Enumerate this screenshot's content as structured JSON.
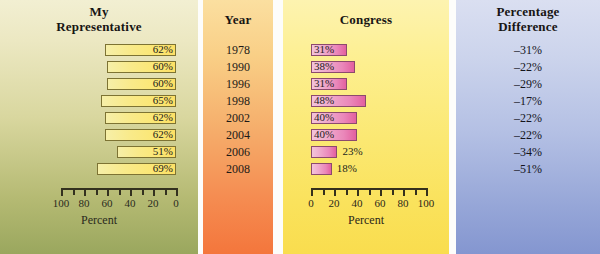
{
  "chart_data": {
    "type": "bar",
    "title": "",
    "categories": [
      "1978",
      "1990",
      "1996",
      "1998",
      "2002",
      "2004",
      "2006",
      "2008"
    ],
    "series": [
      {
        "name": "My Representative",
        "values": [
          62,
          60,
          60,
          65,
          62,
          62,
          51,
          69
        ],
        "unit": "%",
        "direction": "right-to-left",
        "xlim": [
          100,
          0
        ]
      },
      {
        "name": "Congress",
        "values": [
          31,
          38,
          31,
          48,
          40,
          40,
          23,
          18
        ],
        "unit": "%",
        "direction": "left-to-right",
        "xlim": [
          0,
          100
        ]
      }
    ],
    "difference_column": {
      "name": "Percentage Difference",
      "values": [
        -31,
        -22,
        -29,
        -17,
        -22,
        -22,
        -34,
        -51
      ],
      "unit": "%"
    },
    "xlabel": "Percent",
    "ylabel": "Year",
    "grid": false,
    "legend": "none"
  },
  "columns": {
    "representative": {
      "title_line1": "My",
      "title_line2": "Representative",
      "rows": [
        {
          "year": "1978",
          "value": 62,
          "label": "62%"
        },
        {
          "year": "1990",
          "value": 60,
          "label": "60%"
        },
        {
          "year": "1996",
          "value": 60,
          "label": "60%"
        },
        {
          "year": "1998",
          "value": 65,
          "label": "65%"
        },
        {
          "year": "2002",
          "value": 62,
          "label": "62%"
        },
        {
          "year": "2004",
          "value": 62,
          "label": "62%"
        },
        {
          "year": "2006",
          "value": 51,
          "label": "51%"
        },
        {
          "year": "2008",
          "value": 69,
          "label": "69%"
        }
      ],
      "axis": {
        "ticks_major": [
          "100",
          "80",
          "60",
          "40",
          "20",
          "0"
        ],
        "caption": "Percent",
        "min": 0,
        "max": 100,
        "reversed": true
      }
    },
    "year": {
      "title": "Year",
      "values": [
        "1978",
        "1990",
        "1996",
        "1998",
        "2002",
        "2004",
        "2006",
        "2008"
      ]
    },
    "congress": {
      "title": "Congress",
      "rows": [
        {
          "year": "1978",
          "value": 31,
          "label": "31%",
          "label_inside": true
        },
        {
          "year": "1990",
          "value": 38,
          "label": "38%",
          "label_inside": true
        },
        {
          "year": "1996",
          "value": 31,
          "label": "31%",
          "label_inside": true
        },
        {
          "year": "1998",
          "value": 48,
          "label": "48%",
          "label_inside": true
        },
        {
          "year": "2002",
          "value": 40,
          "label": "40%",
          "label_inside": true
        },
        {
          "year": "2004",
          "value": 40,
          "label": "40%",
          "label_inside": true
        },
        {
          "year": "2006",
          "value": 23,
          "label": "23%",
          "label_inside": false
        },
        {
          "year": "2008",
          "value": 18,
          "label": "18%",
          "label_inside": false
        }
      ],
      "axis": {
        "ticks_major": [
          "0",
          "20",
          "40",
          "60",
          "80",
          "100"
        ],
        "caption": "Percent",
        "min": 0,
        "max": 100,
        "reversed": false
      }
    },
    "difference": {
      "title_line1": "Percentage",
      "title_line2": "Difference",
      "values": [
        "–31%",
        "–22%",
        "–29%",
        "–17%",
        "–22%",
        "–22%",
        "–34%",
        "–51%"
      ]
    }
  },
  "colors": {
    "representative_panel": "#d9d79f",
    "year_panel": "#f5ac6a",
    "congress_panel": "#fbe872",
    "difference_panel": "#b4c0e4",
    "representative_bar": "#fbe775",
    "congress_bar": "#ea87ba",
    "text": "#1d1a17"
  }
}
